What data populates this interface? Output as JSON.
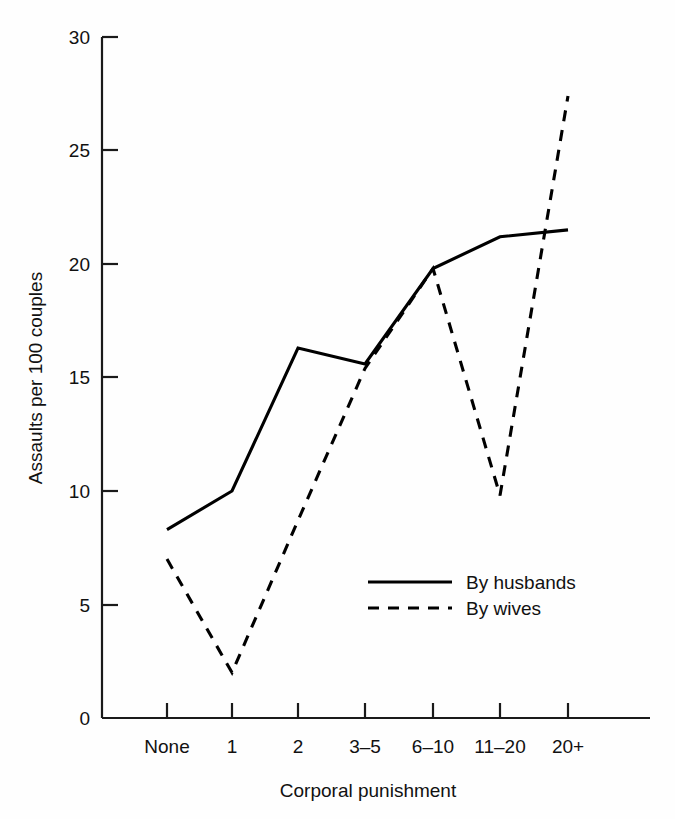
{
  "chart_data": {
    "type": "line",
    "title": "",
    "xlabel": "Corporal punishment",
    "ylabel": "Assaults per 100 couples",
    "categories": [
      "None",
      "1",
      "2",
      "3–5",
      "6–10",
      "11–20",
      "20+"
    ],
    "series": [
      {
        "name": "By husbands",
        "style": "solid",
        "values": [
          8.3,
          10.0,
          16.3,
          15.6,
          19.8,
          21.2,
          21.5
        ]
      },
      {
        "name": "By wives",
        "style": "dashed",
        "values": [
          7.0,
          2.0,
          8.7,
          15.4,
          19.8,
          9.8,
          27.4
        ]
      }
    ],
    "ylim": [
      0,
      30
    ],
    "yticks": [
      0,
      5,
      10,
      15,
      20,
      25,
      30
    ],
    "ytick_labels": [
      "0",
      "5",
      "10",
      "15",
      "20",
      "25",
      "30"
    ],
    "grid": false,
    "legend_position": "center-right-inside",
    "legend_entries": [
      {
        "label": "By husbands",
        "style": "solid"
      },
      {
        "label": "By wives",
        "style": "dashed"
      }
    ],
    "colors": {
      "line": "#000000",
      "axis": "#1a1a1a",
      "text": "#111111",
      "background": "#ffffff"
    }
  }
}
